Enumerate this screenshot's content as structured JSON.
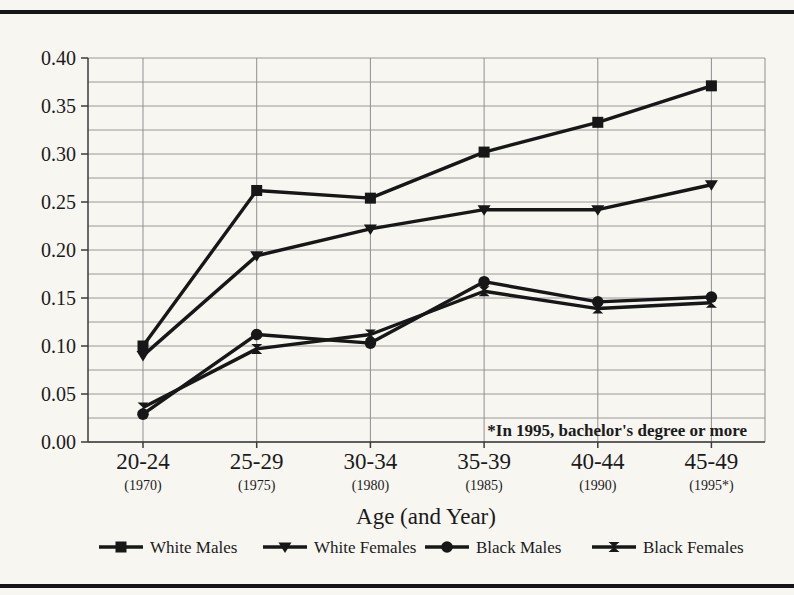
{
  "page": {
    "background_color": "#f7f6f1",
    "rule_color": "#151515",
    "ink_color": "#171717"
  },
  "chart_data": {
    "type": "line",
    "title": "",
    "xlabel": "Age (and Year)",
    "ylabel": "",
    "ylim": [
      0.0,
      0.4
    ],
    "ytick_step": 0.05,
    "minor_grid_step": 0.025,
    "grid": true,
    "legend_position": "bottom",
    "annotation": "*In 1995, bachelor's degree or more",
    "yticklabels": [
      "0.40",
      "0.35",
      "0.30",
      "0.25",
      "0.20",
      "0.15",
      "0.10",
      "0.05",
      "0.00"
    ],
    "categories": [
      "20-24",
      "25-29",
      "30-34",
      "35-39",
      "40-44",
      "45-49"
    ],
    "category_sublabels": [
      "(1970)",
      "(1975)",
      "(1980)",
      "(1985)",
      "(1990)",
      "(1995*)"
    ],
    "series": [
      {
        "name": "White Males",
        "marker": "square",
        "values": [
          0.1,
          0.262,
          0.254,
          0.302,
          0.333,
          0.371
        ]
      },
      {
        "name": "White Females",
        "marker": "triangle-down",
        "values": [
          0.09,
          0.194,
          0.222,
          0.242,
          0.242,
          0.268
        ]
      },
      {
        "name": "Black Males",
        "marker": "circle",
        "values": [
          0.029,
          0.112,
          0.103,
          0.167,
          0.146,
          0.151
        ]
      },
      {
        "name": "Black Females",
        "marker": "bowtie",
        "values": [
          0.036,
          0.097,
          0.112,
          0.157,
          0.139,
          0.145
        ]
      }
    ]
  }
}
